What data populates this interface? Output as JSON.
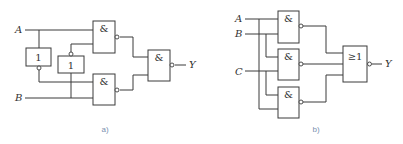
{
  "diagrams": [
    {
      "id": "a",
      "caption": "a)",
      "inputs": [
        "A",
        "B"
      ],
      "output": "Y",
      "gates": [
        {
          "name": "not-1",
          "type": "NOT",
          "symbol": "1"
        },
        {
          "name": "not-2",
          "type": "NOT",
          "symbol": "1"
        },
        {
          "name": "nand-1",
          "type": "NAND",
          "symbol": "&"
        },
        {
          "name": "nand-2",
          "type": "NAND",
          "symbol": "&"
        },
        {
          "name": "nand-3",
          "type": "NAND",
          "symbol": "&"
        }
      ]
    },
    {
      "id": "b",
      "caption": "b)",
      "inputs": [
        "A",
        "B",
        "C"
      ],
      "output": "Y",
      "gates": [
        {
          "name": "nand-1",
          "type": "NAND",
          "symbol": "&"
        },
        {
          "name": "nand-2",
          "type": "NAND",
          "symbol": "&"
        },
        {
          "name": "nand-3",
          "type": "NAND",
          "symbol": "&"
        },
        {
          "name": "nor-1",
          "type": "NOR",
          "symbol": "≥1"
        }
      ]
    }
  ]
}
